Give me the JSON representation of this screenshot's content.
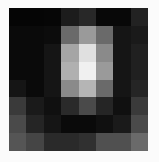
{
  "image": {
    "kind": "grayscale-pixel-grid",
    "rows": 8,
    "cols": 8,
    "background": "#fbfbfb",
    "pixels": [
      [
        "#050505",
        "#050505",
        "#060606",
        "#1c1c1c",
        "#282828",
        "#080808",
        "#080808",
        "#222222"
      ],
      [
        "#0a0a0a",
        "#0a0a0a",
        "#0c0c0c",
        "#6a6a6a",
        "#9a9a9a",
        "#6a6a6a",
        "#151515",
        "#1a1a1a"
      ],
      [
        "#0a0a0a",
        "#0a0a0a",
        "#151515",
        "#a5a5a5",
        "#e0e0e0",
        "#8a8a8a",
        "#151515",
        "#202020"
      ],
      [
        "#0a0a0a",
        "#0a0a0a",
        "#151515",
        "#b0b0b0",
        "#f0f0f0",
        "#9a9a9a",
        "#151515",
        "#202020"
      ],
      [
        "#151515",
        "#0a0a0a",
        "#151515",
        "#8a8a8a",
        "#b5b5b5",
        "#6a6a6a",
        "#151515",
        "#252525"
      ],
      [
        "#3a3a3a",
        "#1a1a1a",
        "#101010",
        "#2a2a2a",
        "#4a4a4a",
        "#252525",
        "#101010",
        "#3a3a3a"
      ],
      [
        "#4a4a4a",
        "#252525",
        "#151515",
        "#0a0a0a",
        "#0a0a0a",
        "#101010",
        "#1a1a1a",
        "#4a4a4a"
      ],
      [
        "#555555",
        "#454545",
        "#2a2a2a",
        "#2a2a2a",
        "#303030",
        "#505050",
        "#505050",
        "#6a6a6a"
      ]
    ]
  }
}
